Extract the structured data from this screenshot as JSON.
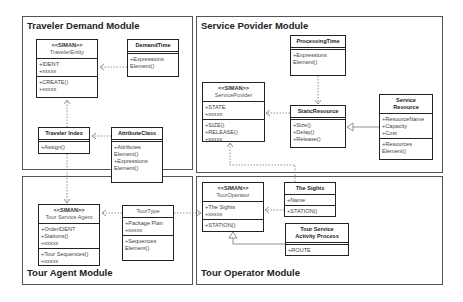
{
  "packages": {
    "traveler_demand": {
      "title": "Traveler Demand Module"
    },
    "service_provider": {
      "title": "Service Povider Module"
    },
    "tour_agent": {
      "title": "Tour Agent Module"
    },
    "tour_operator": {
      "title": "Tour Operator Module"
    }
  },
  "classes": {
    "traveler_entity": {
      "stereotype": "<<SIMAN>>",
      "name": "TravelerEntity",
      "attributes": [
        "+IDENT",
        "+xxxxx"
      ],
      "operations": [
        "+CREATE()",
        "+xxxxx"
      ]
    },
    "demand_time": {
      "name": "DemandTime",
      "operations": [
        "+Expressions",
        "Element()"
      ]
    },
    "traveler_index": {
      "name": "Traveler Index",
      "operations": [
        "+Assign()"
      ]
    },
    "attribute_class": {
      "name": "AttributeClass",
      "operations": [
        "+Attributes",
        "Element()",
        "+Expressions",
        "Element()"
      ]
    },
    "tour_service_agent": {
      "stereotype": "<<SIMAN>>",
      "name": "Tour Service Agent",
      "attributes": [
        "+OrderIDENT",
        "+Stations()",
        "+xxxxx"
      ],
      "operations": [
        "+Tour Sequences()",
        "+xxxxx"
      ]
    },
    "tour_type": {
      "name": "TourType",
      "attributes": [
        "+Package Plan",
        "+xxxxx"
      ],
      "operations": [
        "+Sequences",
        "Element()"
      ]
    },
    "processing_time": {
      "name": "ProcessingTime",
      "operations": [
        "+Expressions",
        "Element()"
      ]
    },
    "service_provider": {
      "stereotype": "<<SIMAN>>",
      "name": "ServicePovider",
      "attributes": [
        "+STATE",
        "+xxxxx"
      ],
      "operations": [
        "+SIZE()",
        "+RELEASE()",
        "+xxxxx"
      ]
    },
    "static_resource": {
      "name": "StaticResource",
      "operations": [
        "+Size()",
        "+Delay()",
        "+Release()"
      ]
    },
    "service_resource": {
      "name_line1": "Service",
      "name_line2": "Resource",
      "attributes": [
        "+ResourceName",
        "+Capacity",
        "+Cost"
      ],
      "operations": [
        "+Resources",
        "Element()"
      ]
    },
    "tour_operator": {
      "stereotype": "<<SIMAN>>",
      "name": "TourOperator",
      "attributes": [
        "+The Sights",
        "+xxxxx"
      ],
      "operations": [
        "+STATION()"
      ]
    },
    "the_sights": {
      "name": "The Sights",
      "attributes": [
        "+Name"
      ],
      "operations": [
        "+STATION()"
      ]
    },
    "tour_service_activity": {
      "name_line1": "Tour Service",
      "name_line2": "Activity Process",
      "operations": [
        "+ROUTE"
      ]
    }
  },
  "colors": {
    "frame": "#555555",
    "box": "#222222",
    "link": "#777777",
    "background": "#ffffff"
  }
}
